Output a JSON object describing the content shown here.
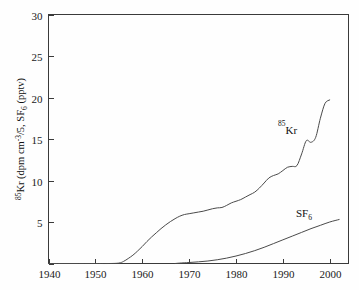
{
  "chart_data": {
    "type": "line",
    "title": "",
    "xlabel": "",
    "ylabel": "85Kr (dpm cm-3/5, SF6 (pptv)",
    "ylabel_parts": {
      "sup1": "85",
      "main1": "Kr (dpm cm",
      "sup2": "-3",
      "main2": "/5, SF",
      "sub1": "6",
      "main3": " (pptv)"
    },
    "xlim": [
      1940,
      2004
    ],
    "ylim": [
      0,
      30
    ],
    "x_ticks": [
      1940,
      1950,
      1960,
      1970,
      1980,
      1990,
      2000
    ],
    "x_tick_labels": [
      "1940",
      "1950",
      "1960",
      "1970",
      "1980",
      "1990",
      "2000"
    ],
    "y_ticks": [
      0,
      5,
      10,
      15,
      20,
      25,
      30
    ],
    "y_tick_labels": [
      "",
      "5",
      "10",
      "15",
      "20",
      "25",
      "30"
    ],
    "grid": false,
    "legend_position": "inline-annotation",
    "series": [
      {
        "name": "85Kr",
        "label_sup": "85",
        "label_main": "Kr",
        "label_x": 1991.0,
        "label_y": 15.6,
        "color": "#4a4a4a",
        "x": [
          1940,
          1950,
          1953,
          1955,
          1956,
          1957,
          1958,
          1959,
          1960,
          1961,
          1962,
          1963,
          1964,
          1965,
          1966,
          1967,
          1968,
          1969,
          1970,
          1971,
          1972,
          1973,
          1974,
          1975,
          1976,
          1977,
          1978,
          1979,
          1980,
          1981,
          1982,
          1983,
          1984,
          1985,
          1986,
          1987,
          1988,
          1989,
          1990,
          1991,
          1992,
          1993,
          1994,
          1995,
          1996,
          1997,
          1998,
          1999,
          2000
        ],
        "values": [
          0.0,
          0.0,
          0.0,
          0.05,
          0.25,
          0.6,
          1.0,
          1.5,
          2.05,
          2.65,
          3.2,
          3.7,
          4.2,
          4.65,
          5.05,
          5.4,
          5.7,
          5.9,
          6.0,
          6.1,
          6.2,
          6.3,
          6.45,
          6.6,
          6.7,
          6.75,
          7.0,
          7.3,
          7.5,
          7.7,
          8.0,
          8.3,
          8.6,
          9.1,
          9.7,
          10.3,
          10.6,
          10.8,
          11.2,
          11.6,
          11.7,
          11.8,
          13.2,
          14.8,
          14.6,
          15.2,
          17.5,
          19.3,
          19.7
        ]
      },
      {
        "name": "SF6",
        "label_main": "SF",
        "label_sub": "6",
        "label_x": 1994.5,
        "label_y": 5.6,
        "color": "#4a4a4a",
        "x": [
          1967,
          1968,
          1970,
          1972,
          1974,
          1976,
          1978,
          1980,
          1982,
          1984,
          1986,
          1988,
          1990,
          1992,
          1994,
          1996,
          1998,
          2000,
          2002
        ],
        "values": [
          0.0,
          0.05,
          0.12,
          0.2,
          0.3,
          0.45,
          0.65,
          0.9,
          1.2,
          1.55,
          1.95,
          2.4,
          2.85,
          3.3,
          3.75,
          4.2,
          4.6,
          5.0,
          5.3
        ]
      }
    ]
  }
}
